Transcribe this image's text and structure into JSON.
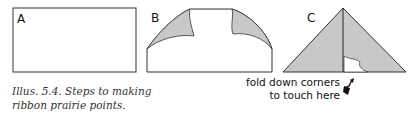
{
  "illustration": {
    "steps": [
      {
        "label": "A",
        "shape": "rectangle"
      },
      {
        "label": "B",
        "shape": "rectangle-with-top-corners-folded-down"
      },
      {
        "label": "C",
        "shape": "triangle-with-center-seam"
      }
    ],
    "caption": {
      "line1": "Illus. 5.4. Steps to making",
      "line2": "ribbon prairie points."
    },
    "annotation": {
      "line1": "fold down corners",
      "line2": "to touch here",
      "icon": "arrow-icon"
    },
    "colors": {
      "fill_gray": "#c8c8c8",
      "stroke": "#222222",
      "background": "#ffffff"
    }
  }
}
